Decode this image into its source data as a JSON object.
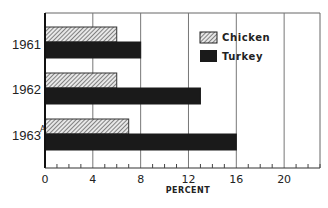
{
  "chart_data": {
    "type": "bar",
    "orientation": "horizontal",
    "title": "",
    "categories": [
      "1961",
      "1962",
      "1963"
    ],
    "category_notes": [
      "",
      "",
      "A"
    ],
    "series": [
      {
        "name": "Chicken",
        "pattern": "hatched",
        "color": "#888888",
        "values": [
          6,
          6,
          7
        ]
      },
      {
        "name": "Turkey",
        "pattern": "solid",
        "color": "#1a1a1a",
        "values": [
          8,
          13,
          16
        ]
      }
    ],
    "xlabel": "PERCENT",
    "ylabel": "",
    "xlim": [
      0,
      23
    ],
    "xticks": [
      0,
      4,
      8,
      12,
      16,
      20
    ],
    "xtick_labels": [
      "0",
      "4",
      "8",
      "12",
      "16",
      "20"
    ],
    "minor_tick_step": 1,
    "grid": true,
    "legend_position": "top-right"
  }
}
